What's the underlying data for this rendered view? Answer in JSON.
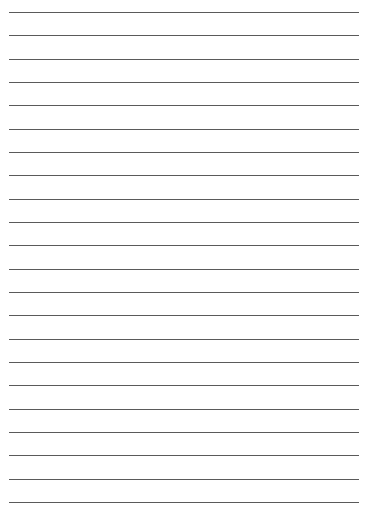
{
  "page": {
    "type": "lined-paper",
    "background_color": "#ffffff",
    "line_color": "#5a5a5a",
    "line_count": 22,
    "first_line_y": 12,
    "line_spacing": 23.33,
    "line_left": 9,
    "line_right": 359
  }
}
